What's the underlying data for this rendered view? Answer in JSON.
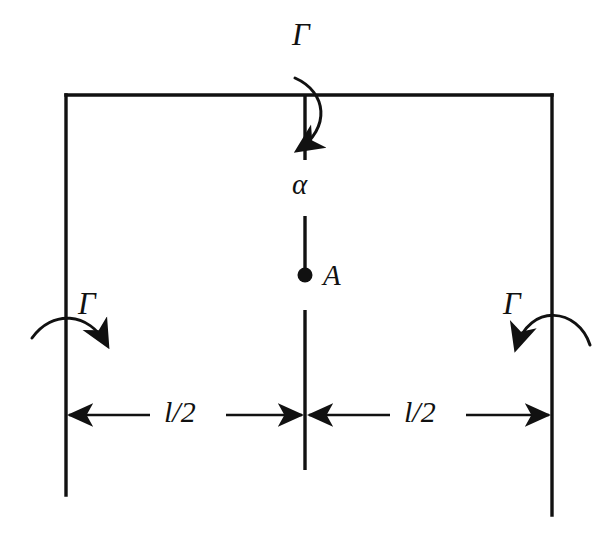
{
  "figure": {
    "type": "engineering-free-body-diagram",
    "background_color": "#ffffff",
    "line_color": "#111111"
  },
  "labels": {
    "torque_top": "Γ",
    "torque_left": "Γ",
    "torque_right": "Γ",
    "angle": "α",
    "point": "A",
    "dimension_left": "l/2",
    "dimension_right": "l/2"
  },
  "geometry": {
    "frame": {
      "top_beam_y": 95,
      "left_column_x": 66,
      "right_column_x": 552,
      "left_column_bottom_y": 495,
      "right_column_bottom_y": 515
    },
    "center_line_x": 305,
    "point_a": {
      "x": 305,
      "y": 275
    },
    "dimension_line_y": 415
  },
  "annotations": {
    "torque_top_arrow_direction": "down-left",
    "torque_left_arrow_direction": "down-right",
    "torque_right_arrow_direction": "down-left",
    "dimension_style": "double-headed-arrows"
  }
}
